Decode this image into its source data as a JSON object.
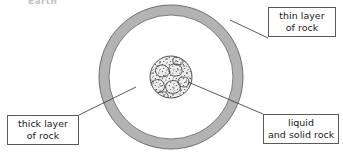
{
  "figure": {
    "title": "Earth"
  },
  "callouts": [
    {
      "id": "thin-layer",
      "line1": "thin layer",
      "line2": "of rock",
      "points_to": "outer ring"
    },
    {
      "id": "thick-layer",
      "line1": "thick layer",
      "line2": "of rock",
      "points_to": "middle region"
    },
    {
      "id": "liquid-solid",
      "line1": "liquid",
      "line2": "and solid rock",
      "points_to": "inner core"
    }
  ],
  "colors": {
    "ring_fill": "#b3b3b3",
    "ring_stroke": "#6e6e6e",
    "mantle_fill": "#ffffff",
    "core_fill": "#e8e8e8",
    "core_stroke": "#555555",
    "leader_line": "#3c3c3c",
    "box_border": "#5a5a5a",
    "text": "#1a1a1a",
    "background": "#ffffff"
  },
  "geometry": {
    "center_x": 171,
    "center_y": 77,
    "outer_radius": 72,
    "ring_inner_radius": 62,
    "core_radius": 21
  }
}
